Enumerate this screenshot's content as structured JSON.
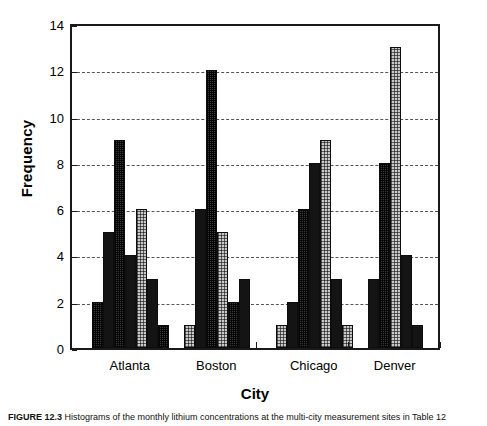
{
  "chart_data": {
    "type": "bar",
    "title": "",
    "xlabel": "City",
    "ylabel": "Frequency",
    "ylim": [
      0,
      14
    ],
    "yticks": [
      0,
      2,
      4,
      6,
      8,
      10,
      12,
      14
    ],
    "grid": "horizontal-dashed",
    "legend": "none",
    "categories": [
      "Atlanta",
      "Boston",
      "Chicago",
      "Denver"
    ],
    "groups": [
      {
        "category": "Atlanta",
        "values": [
          2,
          5,
          9,
          4,
          6,
          3,
          1
        ],
        "fills": [
          "dark",
          "solid",
          "dark",
          "solid",
          "light",
          "solid",
          "dark"
        ]
      },
      {
        "category": "Boston",
        "values": [
          1,
          6,
          12,
          5,
          2,
          3
        ],
        "fills": [
          "light",
          "solid",
          "dark",
          "light",
          "dark",
          "solid"
        ]
      },
      {
        "category": "Chicago",
        "values": [
          1,
          2,
          6,
          8,
          9,
          3,
          1
        ],
        "fills": [
          "light",
          "solid",
          "dark",
          "solid",
          "light",
          "solid",
          "light"
        ]
      },
      {
        "category": "Denver",
        "values": [
          3,
          8,
          13,
          4,
          1
        ],
        "fills": [
          "solid",
          "dark",
          "light",
          "solid",
          "solid"
        ]
      }
    ]
  },
  "caption": {
    "figure_number": "FIGURE 12.3",
    "text": "Histograms of the monthly lithium concentrations at the multi-city measurement sites in Table 12"
  }
}
